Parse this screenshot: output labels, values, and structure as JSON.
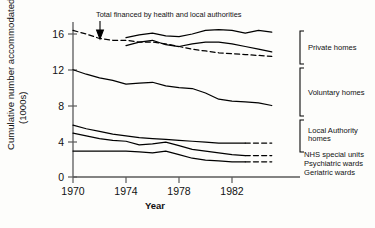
{
  "chart_data": {
    "type": "line",
    "title": "",
    "xlabel": "Year",
    "ylabel": "Cumulative number accommodated (1000s)",
    "xlim": [
      1970,
      1985
    ],
    "ylim": [
      0,
      17.2
    ],
    "xticks": [
      1970,
      1974,
      1978,
      1982
    ],
    "yticks": [
      0,
      4,
      8,
      12,
      16
    ],
    "grid": false,
    "legend_position": "right-brackets",
    "annotations": [
      {
        "text": "Total financed by health and local authorities",
        "target_x": 1972,
        "target_y": 15.4,
        "arrow": "down"
      }
    ],
    "series": [
      {
        "name": "Total financed by health and local authorities",
        "style": "dashed",
        "x": [
          1970,
          1971,
          1972,
          1973,
          1974,
          1975,
          1976,
          1977,
          1978,
          1979,
          1980,
          1981,
          1982,
          1983,
          1984,
          1985
        ],
        "values": [
          16.4,
          16.0,
          15.5,
          15.3,
          15.3,
          15.1,
          15.1,
          14.9,
          14.6,
          14.3,
          14.1,
          13.9,
          13.8,
          13.7,
          13.6,
          13.5
        ]
      },
      {
        "name": "Private homes",
        "style": "solid",
        "x": [
          1974,
          1975,
          1976,
          1977,
          1978,
          1979,
          1980,
          1981,
          1982,
          1983,
          1984,
          1985
        ],
        "values": [
          15.6,
          15.9,
          16.1,
          15.8,
          15.7,
          16.0,
          16.4,
          16.5,
          16.4,
          16.1,
          16.4,
          16.2
        ]
      },
      {
        "name": "Voluntary homes",
        "style": "solid",
        "x": [
          1974,
          1975,
          1976,
          1977,
          1978,
          1979,
          1980,
          1981,
          1982,
          1983,
          1984,
          1985
        ],
        "values": [
          14.7,
          15.1,
          15.3,
          14.8,
          14.6,
          14.9,
          15.1,
          15.1,
          14.9,
          14.6,
          14.3,
          14.0
        ]
      },
      {
        "name": "Local Authority homes",
        "style": "solid",
        "x": [
          1970,
          1971,
          1972,
          1973,
          1974,
          1975,
          1976,
          1977,
          1978,
          1979,
          1980,
          1981,
          1982,
          1983,
          1984,
          1985
        ],
        "values": [
          12.0,
          11.5,
          11.1,
          10.8,
          10.4,
          10.5,
          10.6,
          10.2,
          10.0,
          9.9,
          9.4,
          8.7,
          8.5,
          8.4,
          8.3,
          8.0
        ]
      },
      {
        "name": "NHS special units",
        "style": "solid-to-dashed",
        "dash_from": 1983,
        "x": [
          1970,
          1971,
          1972,
          1973,
          1974,
          1975,
          1976,
          1977,
          1978,
          1979,
          1980,
          1981,
          1982,
          1983,
          1984,
          1985
        ],
        "values": [
          5.8,
          5.4,
          5.1,
          4.8,
          4.6,
          4.4,
          4.3,
          4.2,
          4.1,
          4.0,
          3.9,
          3.8,
          3.8,
          3.8,
          3.8,
          3.8
        ]
      },
      {
        "name": "Psychiatric wards",
        "style": "solid-to-dashed",
        "dash_from": 1983,
        "x": [
          1970,
          1971,
          1972,
          1973,
          1974,
          1975,
          1976,
          1977,
          1978,
          1979,
          1980,
          1981,
          1982,
          1983,
          1984,
          1985
        ],
        "values": [
          4.9,
          4.6,
          4.3,
          4.1,
          4.0,
          3.6,
          3.7,
          3.9,
          3.5,
          3.1,
          2.9,
          2.7,
          2.5,
          2.4,
          2.4,
          2.4
        ]
      },
      {
        "name": "Geriatric wards",
        "style": "solid-to-dashed",
        "dash_from": 1983,
        "x": [
          1970,
          1971,
          1972,
          1973,
          1974,
          1975,
          1976,
          1977,
          1978,
          1979,
          1980,
          1981,
          1982,
          1983,
          1984,
          1985
        ],
        "values": [
          2.9,
          2.9,
          2.9,
          2.9,
          2.9,
          2.8,
          2.7,
          2.9,
          2.5,
          2.1,
          1.9,
          1.8,
          1.7,
          1.7,
          1.7,
          1.7
        ]
      }
    ]
  },
  "axis": {
    "ylabel_line1": "Cumulative number accommodated",
    "ylabel_line2": "(1000s)",
    "xlabel": "Year",
    "yticklabels": [
      "16",
      "12",
      "8",
      "4",
      "0"
    ],
    "xticklabels": [
      "1970",
      "1974",
      "1978",
      "1982"
    ]
  },
  "annotation": {
    "text": "Total financed by health and local authorities"
  },
  "legend": {
    "items": [
      {
        "label": "Private homes"
      },
      {
        "label": "Voluntary homes"
      },
      {
        "label_line1": "Local Authority",
        "label_line2": "homes"
      },
      {
        "label": "NHS special units"
      },
      {
        "label": "Psychiatric wards"
      },
      {
        "label": "Geriatric wards"
      }
    ]
  }
}
